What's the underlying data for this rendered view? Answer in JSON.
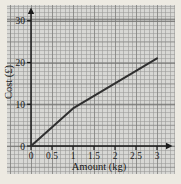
{
  "chart_data": {
    "type": "line",
    "title": "",
    "xlabel": "Amount (kg)",
    "ylabel": "Cost (£)",
    "xlim": [
      0,
      3.3
    ],
    "ylim": [
      0,
      32
    ],
    "x_ticks": [
      0,
      0.5,
      1,
      1.5,
      2,
      2.5,
      3
    ],
    "x_tick_labels": [
      "0",
      "0.5",
      "1",
      "1.5",
      "2",
      "2.5",
      "3"
    ],
    "y_ticks": [
      0,
      10,
      20,
      30
    ],
    "y_tick_labels": [
      "0",
      "10",
      "20",
      "30"
    ],
    "grid": "on (fine graph paper: minor 0.1 kg / £1, major 0.5 kg / £10)",
    "legend": "none",
    "series": [
      {
        "name": "cost-vs-amount-line",
        "points": [
          [
            0,
            0
          ],
          [
            1,
            9
          ],
          [
            3,
            21
          ]
        ],
        "note": "steeper segment 0–1 kg, kink at (1 kg, £9), ends at (3 kg, £21)"
      }
    ]
  },
  "colors": {
    "page_background": "#edeae2",
    "paper_background": "#d8d8d5",
    "axis": "#1b1b1b",
    "line": "#2f2f2f",
    "text": "#1a1a1a"
  }
}
